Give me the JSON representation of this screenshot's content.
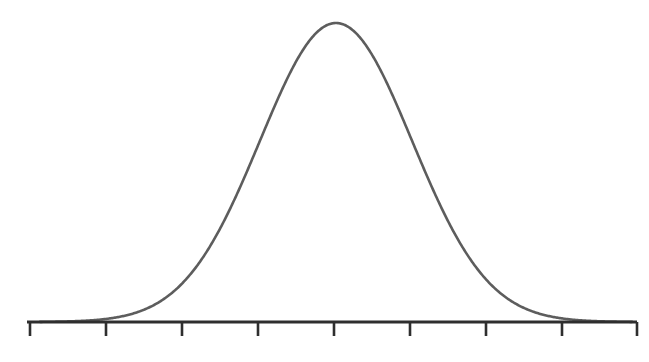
{
  "figure": {
    "title": "",
    "background_color": "#ffffff",
    "width": 649,
    "height": 362
  },
  "axis": {
    "name": "horizontal-axis",
    "color": "#2e2e2e",
    "stroke_width": 3,
    "y": 322,
    "x_start": 27,
    "x_end": 637,
    "tick_color": "#2e2e2e",
    "tick_stroke_width": 2.6,
    "tick_length": 14,
    "tick_positions": [
      30,
      106,
      182,
      258,
      334,
      410,
      486,
      562,
      637
    ],
    "tick_labels": [
      "",
      "",
      "",
      "",
      "",
      "",
      "",
      "",
      ""
    ]
  },
  "curve": {
    "name": "gaussian-bell-curve",
    "color": "#5d5d5d",
    "stroke_width": 2.6,
    "peak_x": 336,
    "peak_y": 23,
    "baseline_y": 322,
    "sigma": 76,
    "amplitude": 299,
    "x_domain_start": 40,
    "x_domain_end": 632
  },
  "chart_data": {
    "type": "line",
    "title": "",
    "subtitle": "",
    "xlabel": "",
    "ylabel": "",
    "grid": false,
    "legend": false,
    "legend_position": "none",
    "distribution": "normal",
    "mean": 0,
    "stddev": 1,
    "xlim": [
      -4,
      4
    ],
    "ylim": [
      0,
      1
    ],
    "axis_tick_values": [
      -4,
      -3,
      -2,
      -1,
      0,
      1,
      2,
      3,
      4
    ],
    "axis_tick_labels": [
      "",
      "",
      "",
      "",
      "",
      "",
      "",
      "",
      ""
    ],
    "series": [
      {
        "name": "normal-pdf",
        "color": "#5d5d5d",
        "x": [
          -4.0,
          -3.75,
          -3.5,
          -3.25,
          -3.0,
          -2.75,
          -2.5,
          -2.25,
          -2.0,
          -1.75,
          -1.5,
          -1.25,
          -1.0,
          -0.75,
          -0.5,
          -0.25,
          0.0,
          0.25,
          0.5,
          0.75,
          1.0,
          1.25,
          1.5,
          1.75,
          2.0,
          2.25,
          2.5,
          2.75,
          3.0,
          3.25,
          3.5,
          3.75,
          4.0
        ],
        "values": [
          0.0003,
          0.0009,
          0.0022,
          0.0051,
          0.0111,
          0.0228,
          0.0439,
          0.0796,
          0.1353,
          0.2163,
          0.3247,
          0.4578,
          0.6065,
          0.7548,
          0.8825,
          0.9692,
          1.0,
          0.9692,
          0.8825,
          0.7548,
          0.6065,
          0.4578,
          0.3247,
          0.2163,
          0.1353,
          0.0796,
          0.0439,
          0.0228,
          0.0111,
          0.0051,
          0.0022,
          0.0009,
          0.0003
        ]
      }
    ]
  }
}
